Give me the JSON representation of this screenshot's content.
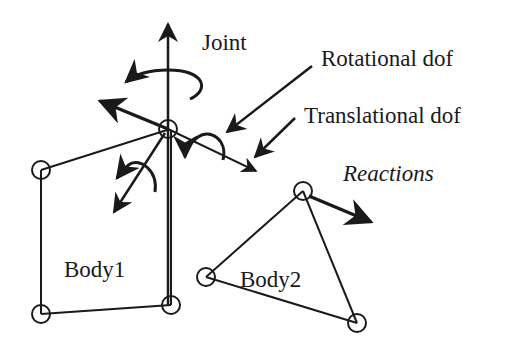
{
  "diagram": {
    "labels": {
      "joint": "Joint",
      "rotational_dof": "Rotational dof",
      "translational_dof": "Translational dof",
      "reactions": "Reactions",
      "body1": "Body1",
      "body2": "Body2"
    },
    "colors": {
      "stroke": "#1a1a1a",
      "background": "#ffffff"
    }
  }
}
